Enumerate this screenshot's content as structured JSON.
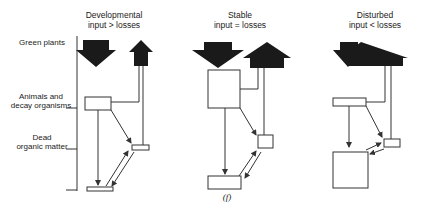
{
  "figure": {
    "caption": "(f)",
    "row_labels": [
      {
        "id": "green-plants",
        "text": "Green plants"
      },
      {
        "id": "animals",
        "line1": "Animals and",
        "line2": "decay organisms"
      },
      {
        "id": "dead-matter",
        "line1": "Dead",
        "line2": "organic matter"
      }
    ],
    "panels": [
      {
        "id": "developmental",
        "title": "Developmental",
        "relation": "input > losses"
      },
      {
        "id": "stable",
        "title": "Stable",
        "relation": "input = losses"
      },
      {
        "id": "disturbed",
        "title": "Disturbed",
        "relation": "input < losses"
      }
    ],
    "colors": {
      "ink": "#1a1a1a",
      "line": "#333333",
      "box_fill": "#ffffff"
    }
  }
}
